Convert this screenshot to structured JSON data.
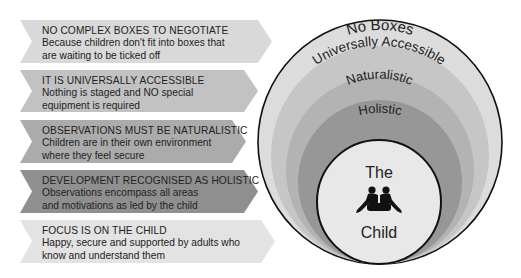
{
  "arrows": [
    {
      "title": "NO COMPLEX BOXES TO NEGOTIATE",
      "line1": "Because children don't fit into boxes that",
      "line2": "are waiting to be ticked off",
      "color": "#d9d9d9"
    },
    {
      "title": "IT IS UNIVERSALLY ACCESSIBLE",
      "line1": "Nothing is staged and NO special",
      "line2": "equipment is required",
      "color": "#c2c2c2"
    },
    {
      "title": "OBSERVATIONS MUST BE NATURALISTIC",
      "line1": "Children are in their own environment",
      "line2": "where they feel secure",
      "color": "#ababab"
    },
    {
      "title": "DEVELOPMENT RECOGNISED AS HOLISTIC",
      "line1": "Observations encompass all areas",
      "line2": "and motivations as led by the child",
      "color": "#8f8f8f"
    },
    {
      "title": "FOCUS IS ON THE CHILD",
      "line1": "Happy, secure and supported by adults who",
      "line2": "know and understand them",
      "color": "#e3e3e3"
    }
  ],
  "circles": {
    "no_boxes": "No Boxes",
    "universally_accessible": "Universally Accessible",
    "naturalistic": "Naturalistic",
    "holistic": "Holistic",
    "child_top": "The",
    "child_bottom": "Child"
  },
  "colors": {
    "ring1": "#dcdcdc",
    "ring2": "#c6c6c6",
    "ring3": "#b3b3b3",
    "ring4": "#979797",
    "core": "#e8e8e8",
    "stroke": "#111111"
  }
}
